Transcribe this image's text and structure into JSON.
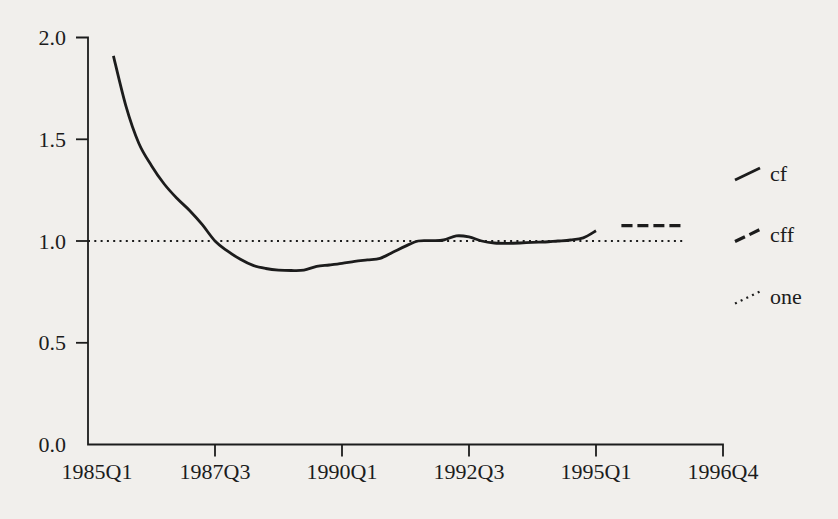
{
  "colors": {
    "ink": "#1c1c1c",
    "background": "#f1efec"
  },
  "chart_data": {
    "type": "line",
    "title": "",
    "xlabel": "",
    "ylabel": "",
    "ylim": [
      0.0,
      2.0
    ],
    "grid": false,
    "yticks": [
      0.0,
      0.5,
      1.0,
      1.5,
      2.0
    ],
    "ytick_labels": [
      "0.0",
      "0.5",
      "1.0",
      "1.5",
      "2.0"
    ],
    "xtick_labels": [
      "1985Q1",
      "1987Q3",
      "1990Q1",
      "1992Q3",
      "1995Q1",
      "1996Q4"
    ],
    "legend": {
      "position": "right",
      "entries": [
        "cf",
        "cff",
        "one"
      ]
    },
    "series": [
      {
        "name": "cf",
        "style": "solid",
        "x": [
          "1985Q3",
          "1985Q4",
          "1986Q1",
          "1986Q2",
          "1986Q3",
          "1986Q4",
          "1987Q1",
          "1987Q2",
          "1987Q3",
          "1987Q4",
          "1988Q1",
          "1988Q2",
          "1988Q3",
          "1988Q4",
          "1989Q1",
          "1989Q2",
          "1989Q3",
          "1989Q4",
          "1990Q1",
          "1990Q2",
          "1990Q3",
          "1990Q4",
          "1991Q1",
          "1991Q2",
          "1991Q3",
          "1991Q4",
          "1992Q1",
          "1992Q2",
          "1992Q3",
          "1992Q4",
          "1993Q1",
          "1993Q2",
          "1993Q3",
          "1993Q4",
          "1994Q1",
          "1994Q2",
          "1994Q3",
          "1994Q4",
          "1995Q1"
        ],
        "values": [
          1.91,
          1.66,
          1.48,
          1.37,
          1.28,
          1.21,
          1.15,
          1.08,
          1.0,
          0.95,
          0.91,
          0.88,
          0.865,
          0.857,
          0.855,
          0.857,
          0.875,
          0.882,
          0.89,
          0.9,
          0.907,
          0.915,
          0.945,
          0.975,
          1.0,
          1.002,
          1.005,
          1.025,
          1.02,
          1.0,
          0.99,
          0.988,
          0.99,
          0.993,
          0.995,
          1.0,
          1.005,
          1.015,
          1.05
        ]
      },
      {
        "name": "cff",
        "style": "dashed",
        "x": [
          "1995Q3",
          "1995Q4",
          "1996Q1",
          "1996Q2",
          "1996Q3",
          "1996Q4"
        ],
        "values": [
          1.075,
          1.075,
          1.075,
          1.075,
          1.075,
          1.075
        ]
      },
      {
        "name": "one",
        "style": "dotted",
        "x": [
          "1985Q1",
          "1996Q4"
        ],
        "values": [
          1.0,
          1.0
        ]
      }
    ]
  }
}
